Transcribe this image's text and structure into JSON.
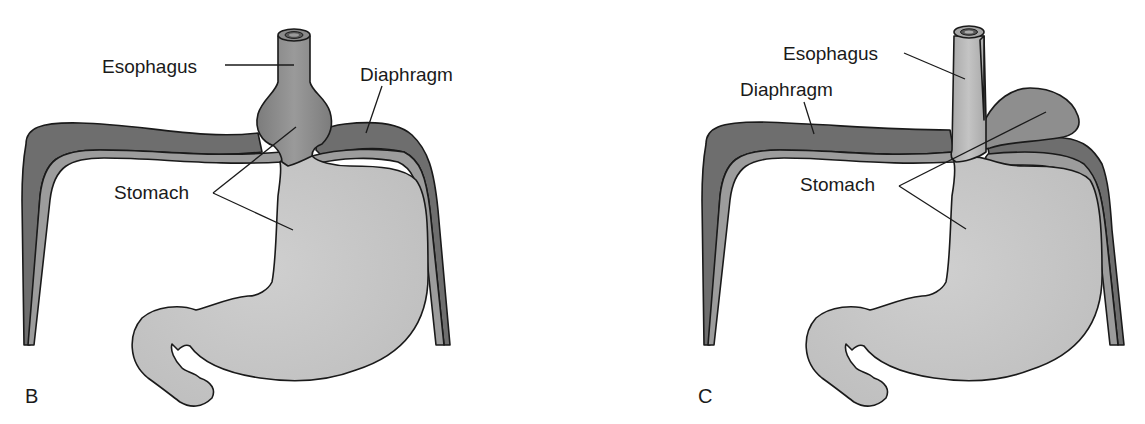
{
  "figure": {
    "colors": {
      "background": "#ffffff",
      "stomach_fill": "#c8c8c8",
      "diaphragm_dark": "#6e6e6e",
      "diaphragm_light": "#9a9a9a",
      "herniated_fill": "#8c8c8c",
      "esophagus_fill_B": "#8a8a8a",
      "esophagus_fill_C": "#b4b4b4",
      "outline": "#1a1a1a"
    }
  },
  "panels": [
    {
      "id": "B",
      "letter": "B",
      "labels": {
        "esophagus": "Esophagus",
        "diaphragm": "Diaphragm",
        "stomach": "Stomach"
      }
    },
    {
      "id": "C",
      "letter": "C",
      "labels": {
        "esophagus": "Esophagus",
        "diaphragm": "Diaphragm",
        "stomach": "Stomach"
      }
    }
  ]
}
